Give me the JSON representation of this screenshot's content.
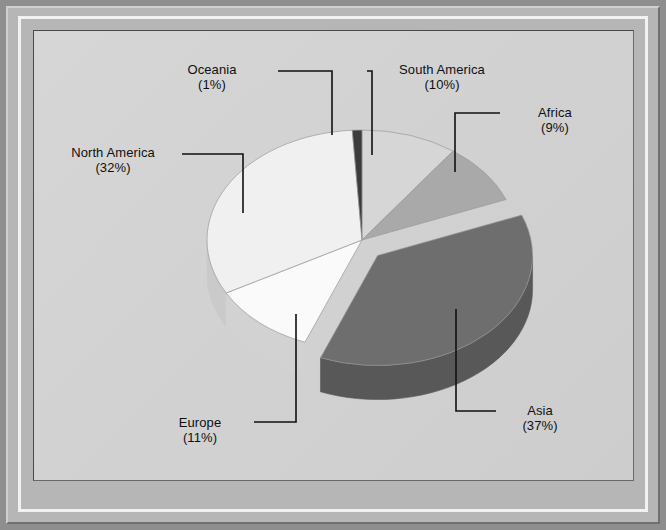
{
  "panel": {
    "background_color": "#d3d3d3",
    "frame_color": "#b6b6b6",
    "frame_outer_color": "#8e8e8e"
  },
  "chart_data": {
    "type": "pie",
    "title": "",
    "subtitle": "",
    "xlabel": "",
    "ylabel": "",
    "legend_position": "callout-labels",
    "grid": false,
    "three_d": true,
    "exploded_slice": "Asia",
    "start_angle_deg": -90,
    "direction": "clockwise",
    "categories": [
      "South America",
      "Africa",
      "Asia",
      "Europe",
      "North America",
      "Oceania"
    ],
    "values": [
      10,
      9,
      37,
      11,
      32,
      1
    ],
    "value_labels": [
      "(10%)",
      "(9%)",
      "(37%)",
      "(11%)",
      "(32%)",
      "(1%)"
    ],
    "unit": "%",
    "total": 100,
    "slices": [
      {
        "name": "South America",
        "value": 10,
        "pct_label": "(10%)",
        "color": "#d6d6d6",
        "side_color": "#b3b3b3"
      },
      {
        "name": "Africa",
        "value": 9,
        "pct_label": "(9%)",
        "color": "#a9a9a9",
        "side_color": "#8d8d8d"
      },
      {
        "name": "Asia",
        "value": 37,
        "pct_label": "(37%)",
        "color": "#6e6e6e",
        "side_color": "#585858"
      },
      {
        "name": "Europe",
        "value": 11,
        "pct_label": "(11%)",
        "color": "#fafafa",
        "side_color": "#d2d2d2"
      },
      {
        "name": "North America",
        "value": 32,
        "pct_label": "(32%)",
        "color": "#f0f0f0",
        "side_color": "#cacaca"
      },
      {
        "name": "Oceania",
        "value": 1,
        "pct_label": "(1%)",
        "color": "#3c3c3c",
        "side_color": "#2e2e2e"
      }
    ]
  },
  "labels": {
    "oceania": {
      "name": "Oceania",
      "pct": "(1%)"
    },
    "south_america": {
      "name": "South America",
      "pct": "(10%)"
    },
    "africa": {
      "name": "Africa",
      "pct": "(9%)"
    },
    "north_america": {
      "name": "North America",
      "pct": "(32%)"
    },
    "europe": {
      "name": "Europe",
      "pct": "(11%)"
    },
    "asia": {
      "name": "Asia",
      "pct": "(37%)"
    }
  }
}
